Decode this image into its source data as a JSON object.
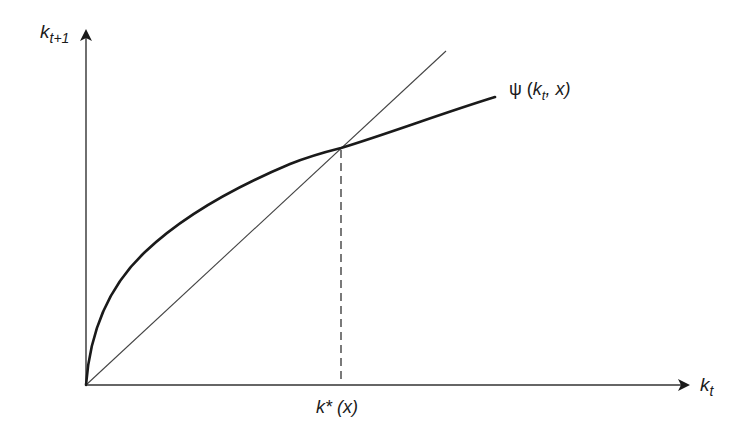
{
  "diagram": {
    "type": "phase diagram",
    "colors": {
      "background": "#ffffff",
      "ink": "#1a1a1a",
      "thin_line": "#333333"
    },
    "y_axis": {
      "label_main": "k",
      "label_sub": "t+1"
    },
    "x_axis": {
      "label_main": "k",
      "label_sub": "t"
    },
    "curve": {
      "name": "psi",
      "label_func": "ψ (",
      "label_k": "k",
      "label_sub": "t",
      "label_rest": ", x)"
    },
    "line_45": {
      "description": "45-degree line k_{t+1} = k_t"
    },
    "steady_state": {
      "label_main": "k* (x)",
      "description": "dashed vertical line from intersection to x-axis"
    }
  }
}
